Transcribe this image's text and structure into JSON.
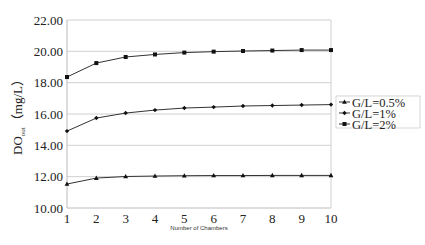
{
  "chart_data": {
    "type": "line",
    "title": "",
    "xlabel": "Number of Chambers",
    "ylabel": "DO",
    "ylabel_subscript": "out",
    "ylabel_unit": "（mg/L）",
    "x": [
      1,
      2,
      3,
      4,
      5,
      6,
      7,
      8,
      9,
      10
    ],
    "xlim": [
      1,
      10
    ],
    "ylim": [
      10,
      22
    ],
    "yticks": [
      "10.00",
      "12.00",
      "14.00",
      "16.00",
      "18.00",
      "20.00",
      "22.00"
    ],
    "ytick_values": [
      10,
      12,
      14,
      16,
      18,
      20,
      22
    ],
    "xticks": [
      "1",
      "2",
      "3",
      "4",
      "5",
      "6",
      "7",
      "8",
      "9",
      "10"
    ],
    "grid": "horizontal",
    "legend_position": "right",
    "series": [
      {
        "name": "G/L=0.5%",
        "marker": "triangle",
        "values": [
          11.53,
          11.91,
          12.01,
          12.04,
          12.06,
          12.07,
          12.07,
          12.08,
          12.08,
          12.08
        ]
      },
      {
        "name": "G/L=1%",
        "marker": "diamond",
        "values": [
          14.91,
          15.74,
          16.06,
          16.25,
          16.38,
          16.44,
          16.51,
          16.54,
          16.57,
          16.6
        ]
      },
      {
        "name": "G/L=2%",
        "marker": "square",
        "values": [
          18.36,
          19.25,
          19.64,
          19.8,
          19.92,
          19.98,
          20.02,
          20.05,
          20.08,
          20.08
        ]
      }
    ],
    "colors": {
      "line": "#333333",
      "grid": "#d0d0d0",
      "axis": "#bbbbbb"
    }
  }
}
